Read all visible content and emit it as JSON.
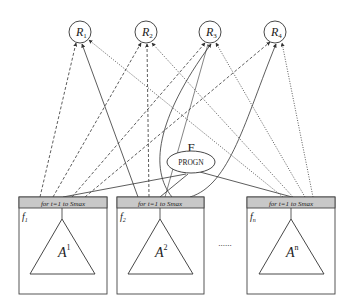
{
  "resources": [
    {
      "id": "R1",
      "label": "R",
      "sub": "1",
      "cx": 80,
      "cy": 32
    },
    {
      "id": "R2",
      "label": "R",
      "sub": "2",
      "cx": 146,
      "cy": 32
    },
    {
      "id": "R3",
      "label": "R",
      "sub": "3",
      "cx": 210,
      "cy": 32
    },
    {
      "id": "R4",
      "label": "R",
      "sub": "4",
      "cx": 275,
      "cy": 32
    }
  ],
  "root": {
    "label": "F",
    "node": "PROGN"
  },
  "functions": [
    {
      "id": "f1",
      "label": "f",
      "sub": "1",
      "header": "for t=1 to Smax",
      "tree": "A",
      "sup": "1",
      "x": 19
    },
    {
      "id": "f2",
      "label": "f",
      "sub": "2",
      "header": "for t=1 to Smax",
      "tree": "A",
      "sup": "2",
      "x": 117
    },
    {
      "id": "fn",
      "label": "f",
      "sub": "n",
      "header": "for t=1 to Smax",
      "tree": "A",
      "sup": "n",
      "x": 247
    }
  ],
  "ellipsis": "......",
  "colors": {
    "stroke": "#333333",
    "header_fill": "#c8c8c8",
    "box_stroke": "#444444"
  }
}
